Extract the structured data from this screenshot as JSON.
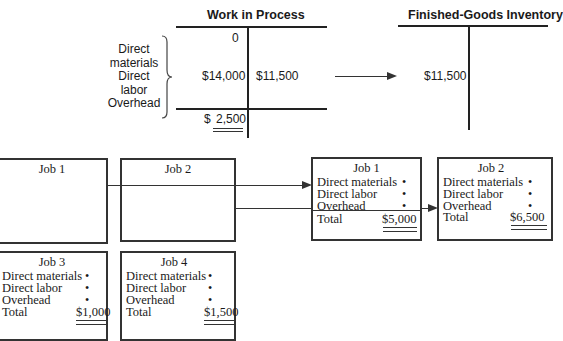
{
  "t_accounts": {
    "wip": {
      "title": "Work in Process",
      "debit_entries": [
        "0",
        "$14,000"
      ],
      "credit_entries": [
        "$11,500"
      ],
      "balance_prefix": "$",
      "balance": "2,500",
      "cost_labels": [
        "Direct",
        "materials",
        "Direct",
        "labor",
        "Overhead"
      ]
    },
    "fgi": {
      "title": "Finished-Goods Inventory",
      "debit_entries": [
        "$11,500"
      ]
    }
  },
  "job_cost_sheets": {
    "open": [
      {
        "title": "Job 1"
      },
      {
        "title": "Job 2"
      }
    ],
    "completed": [
      {
        "title": "Job 1",
        "rows": [
          "Direct materials",
          "Direct labor",
          "Overhead"
        ],
        "dot": "•",
        "total_label": "Total",
        "total": "$5,000"
      },
      {
        "title": "Job 2",
        "rows": [
          "Direct materials",
          "Direct labor",
          "Overhead"
        ],
        "dot": "•",
        "total_label": "Total",
        "total": "$6,500"
      }
    ],
    "in_process": [
      {
        "title": "Job 3",
        "rows": [
          "Direct materials",
          "Direct labor",
          "Overhead"
        ],
        "dot": "•",
        "total_label": "Total",
        "total": "$1,000"
      },
      {
        "title": "Job 4",
        "rows": [
          "Direct materials",
          "Direct labor",
          "Overhead"
        ],
        "dot": "•",
        "total_label": "Total",
        "total": "$1,500"
      }
    ]
  },
  "colors": {
    "line": "#222222",
    "text": "#1a1a1a",
    "background": "#ffffff"
  }
}
